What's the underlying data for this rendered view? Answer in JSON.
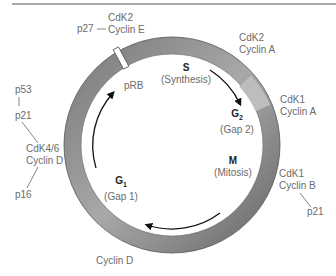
{
  "diagram": {
    "colors": {
      "ring": "#9a9a9a",
      "ring_dark": "#6e6e6e",
      "ring_light": "#c4c4c4",
      "arrow": "#111111",
      "text": "#6b6b6b",
      "rule": "#555555"
    },
    "phases": [
      {
        "name": "S",
        "sub": "",
        "desc": "(Synthesis)"
      },
      {
        "name": "G",
        "sub": "2",
        "desc": "(Gap 2)"
      },
      {
        "name": "M",
        "sub": "",
        "desc": "(Mitosis)"
      },
      {
        "name": "G",
        "sub": "1",
        "desc": "(Gap 1)"
      }
    ],
    "labels": {
      "cdk2_e_line1": "CdK2",
      "cdk2_e_line2": "Cyclin E",
      "p27": "p27",
      "prb": "pRB",
      "cdk2_a_line1": "CdK2",
      "cdk2_a_line2": "Cyclin A",
      "cdk1_a_line1": "CdK1",
      "cdk1_a_line2": "Cyclin A",
      "cdk1_b_line1": "CdK1",
      "cdk1_b_line2": "Cyclin B",
      "p21_right": "p21",
      "p53": "p53",
      "p21_left": "p21",
      "cdk46_line1": "CdK4/6",
      "cdk46_line2": "Cyclin D",
      "p16": "p16",
      "cyclin_d_bottom": "Cyclin D"
    }
  }
}
